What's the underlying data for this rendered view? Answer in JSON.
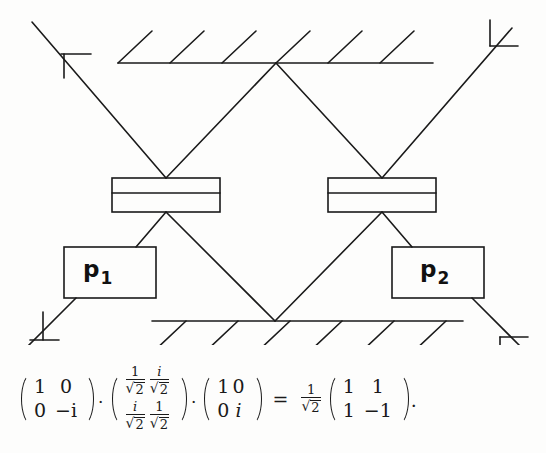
{
  "figure": {
    "type": "mach-zehnder-interferometer",
    "ink_color": "#1a1a1a",
    "background_color": "#fdfdfc",
    "components": {
      "top_mirror": {
        "name": "mirror-top",
        "hatch_count": 6,
        "hatch_direction": "up-right"
      },
      "bottom_mirror": {
        "name": "mirror-bottom",
        "hatch_count": 6,
        "hatch_direction": "down-left"
      },
      "beam_splitter_left": {
        "name": "beam-splitter-left"
      },
      "beam_splitter_right": {
        "name": "beam-splitter-right"
      },
      "phase_shifter_left": {
        "label": "p",
        "subscript": "1"
      },
      "phase_shifter_right": {
        "label": "p",
        "subscript": "2"
      },
      "port_markers": [
        {
          "name": "port-top-left"
        },
        {
          "name": "port-top-right"
        },
        {
          "name": "port-bottom-left"
        },
        {
          "name": "port-bottom-right"
        }
      ]
    }
  },
  "formula": {
    "matrix1": {
      "r1c1": "1",
      "r1c2": "0",
      "r2c1": "0",
      "r2c2": "−i"
    },
    "op1": "·",
    "matrix2": {
      "r1c1_num": "1",
      "r1c1_den": "2",
      "r1c2_num": "i",
      "r1c2_den": "2",
      "r2c1_num": "i",
      "r2c1_den": "2",
      "r2c2_num": "1",
      "r2c2_den": "2"
    },
    "op2": "·",
    "matrix3": {
      "r1c1": "1",
      "r1c2": "0",
      "r2c1": "0",
      "r2c2": "i"
    },
    "equals": "=",
    "prefactor": {
      "num": "1",
      "den": "2"
    },
    "result": {
      "r1c1": "1",
      "r1c2": "1",
      "r2c1": "1",
      "r2c2": "−1"
    },
    "terminator": "·",
    "radical": "√"
  }
}
